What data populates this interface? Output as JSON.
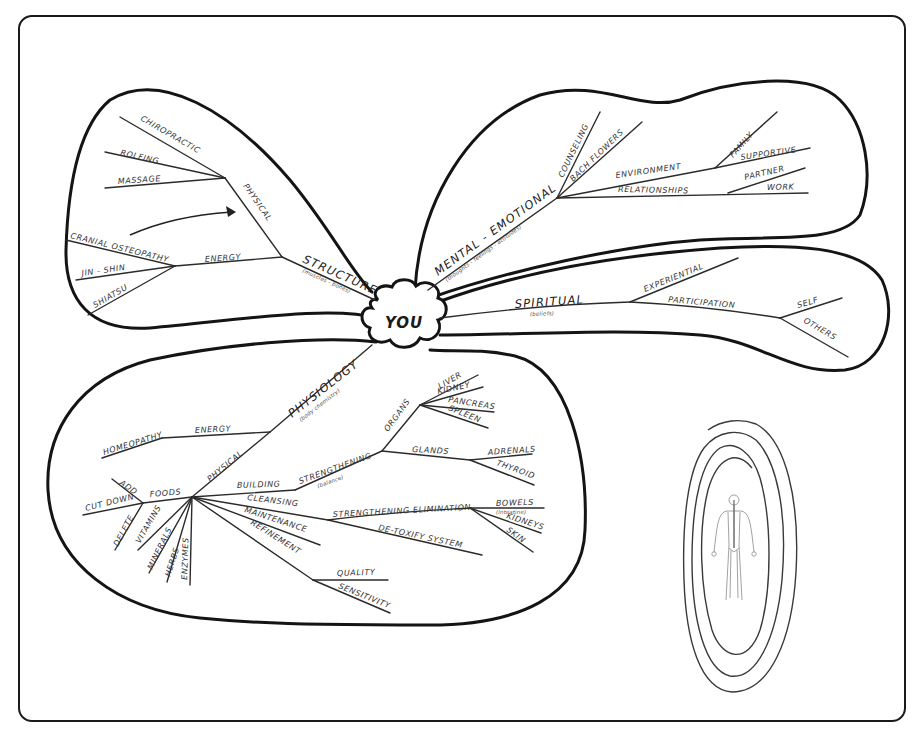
{
  "center": {
    "label": "YOU"
  },
  "structure_lobe": {
    "root": {
      "label": "STRUCTURE",
      "sub": "(muscles - bones)"
    },
    "physical": {
      "label": "PHYSICAL",
      "children": [
        "CHIROPRACTIC",
        "ROLFING",
        "MASSAGE"
      ]
    },
    "energy": {
      "label": "ENERGY",
      "children": [
        "CRANIAL OSTEOPATHY",
        "JIN - SHIN",
        "SHIATSU"
      ]
    }
  },
  "mental_lobe": {
    "root": {
      "label": "MENTAL - EMOTIONAL",
      "sub": "(thoughts - feelings - attitudes)"
    },
    "branches": [
      "COUNSELING",
      "BACH FLOWERS"
    ],
    "environment": {
      "label": "ENVIRONMENT",
      "children": [
        "FAMILY",
        "SUPPORTIVE"
      ]
    },
    "relationships": {
      "label": "RELATIONSHIPS",
      "children": [
        "PARTNER",
        "WORK"
      ]
    }
  },
  "spiritual_lobe": {
    "root": {
      "label": "SPIRITUAL",
      "sub": "(beliefs)"
    },
    "experiential": {
      "label": "EXPERIENTIAL"
    },
    "participation": {
      "label": "PARTICIPATION",
      "children": [
        "SELF",
        "OTHERS"
      ]
    }
  },
  "physiology_lobe": {
    "root": {
      "label": "PHYSIOLOGY",
      "sub": "(body chemistry)"
    },
    "energy": {
      "label": "ENERGY",
      "children": [
        "HOMEOPATHY"
      ]
    },
    "physical": {
      "label": "PHYSICAL"
    },
    "foods": {
      "label": "FOODS",
      "children": [
        "ADD",
        "CUT DOWN",
        "DELETE"
      ]
    },
    "supplements": [
      "VITAMINS",
      "MINERALS",
      "HERBS",
      "ENZYMES"
    ],
    "building": {
      "label": "BUILDING"
    },
    "strengthening": {
      "label": "STRENGTHENING",
      "sub": "(balance)"
    },
    "organs": {
      "label": "ORGANS",
      "children": [
        "LIVER",
        "KIDNEY",
        "PANCREAS",
        "SPLEEN"
      ]
    },
    "glands": {
      "label": "GLANDS",
      "children": [
        "ADRENALS",
        "THYROID"
      ]
    },
    "cleansing": {
      "label": "CLEANSING"
    },
    "strengthening_elimination": {
      "label": "STRENGTHENING ELIMINATION",
      "children": [
        "BOWELS",
        "KIDNEYS",
        "SKIN"
      ],
      "bowels_sub": "(intestine)"
    },
    "detoxify": {
      "label": "DE-TOXIFY SYSTEM"
    },
    "maintenance": {
      "label": "MAINTENANCE"
    },
    "refinement": {
      "label": "REFINEMENT",
      "children": [
        "QUALITY",
        "SENSITIVITY"
      ]
    }
  },
  "illustration": {
    "name": "human-nervous-system-figure-in-spiral"
  }
}
